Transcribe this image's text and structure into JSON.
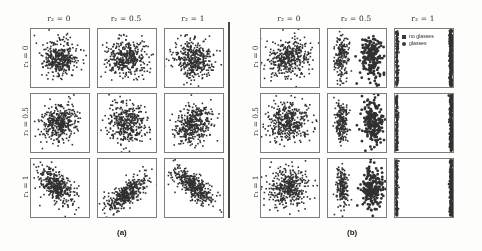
{
  "figure": {
    "panels": [
      {
        "id": "a",
        "caption": "(a)",
        "col_headers": [
          "r₂ = 0",
          "r₂ = 0.5",
          "r₂ = 1"
        ],
        "row_labels": [
          "r₁ = 0",
          "r₁ = 0.5",
          "r₁ = 1"
        ]
      },
      {
        "id": "b",
        "caption": "(b)",
        "col_headers": [
          "r₂ = 0",
          "r₂ = 0.5",
          "r₂ = 1"
        ],
        "row_labels": [
          "r₁ = 0",
          "r₁ = 0.5",
          "r₁ = 1"
        ]
      }
    ],
    "legend": {
      "entries": [
        {
          "label": "no glasses",
          "marker": "square-marker",
          "color": "#3b3b3b"
        },
        {
          "label": "glasses",
          "marker": "circle-marker",
          "color": "#3b3b3b"
        }
      ]
    }
  },
  "chart_data": {
    "type": "scatter",
    "title": "",
    "xlabel": "",
    "ylabel": "",
    "grid": false,
    "legend_position": "inside-top-right-cell",
    "point_color": "#333333",
    "point_size": 1.6,
    "xlim": [
      0,
      1
    ],
    "ylim": [
      0,
      1
    ],
    "row_param": "r₁",
    "col_param": "r₂",
    "row_values": [
      0,
      0.5,
      1
    ],
    "col_values": [
      0,
      0.5,
      1
    ],
    "n_points_per_cell": 400,
    "panels": [
      {
        "id": "a",
        "caption": "(a)",
        "description": "Embedding without disentanglement; single diffuse cloud per cell, becoming elongated and correlated as r1 increases",
        "cells": [
          {
            "row": 0,
            "col": 0,
            "mode": "blob",
            "cx": 0.5,
            "cy": 0.5,
            "sx": 0.155,
            "sy": 0.155,
            "rho": 0.0,
            "clusters": 1,
            "sep": 0.0
          },
          {
            "row": 0,
            "col": 1,
            "mode": "blob",
            "cx": 0.5,
            "cy": 0.5,
            "sx": 0.17,
            "sy": 0.16,
            "rho": 0.05,
            "clusters": 1,
            "sep": 0.0
          },
          {
            "row": 0,
            "col": 2,
            "mode": "blob",
            "cx": 0.5,
            "cy": 0.48,
            "sx": 0.165,
            "sy": 0.16,
            "rho": -0.05,
            "clusters": 1,
            "sep": 0.0
          },
          {
            "row": 1,
            "col": 0,
            "mode": "blob",
            "cx": 0.5,
            "cy": 0.5,
            "sx": 0.155,
            "sy": 0.16,
            "rho": 0.15,
            "clusters": 1,
            "sep": 0.0
          },
          {
            "row": 1,
            "col": 1,
            "mode": "blob",
            "cx": 0.5,
            "cy": 0.5,
            "sx": 0.17,
            "sy": 0.165,
            "rho": 0.0,
            "clusters": 1,
            "sep": 0.0
          },
          {
            "row": 1,
            "col": 2,
            "mode": "blob",
            "cx": 0.49,
            "cy": 0.48,
            "sx": 0.16,
            "sy": 0.16,
            "rho": 0.1,
            "clusters": 1,
            "sep": 0.0
          },
          {
            "row": 2,
            "col": 0,
            "mode": "blob",
            "cx": 0.44,
            "cy": 0.52,
            "sx": 0.15,
            "sy": 0.165,
            "rho": -0.55,
            "clusters": 1,
            "sep": 0.0
          },
          {
            "row": 2,
            "col": 1,
            "mode": "blob",
            "cx": 0.52,
            "cy": 0.42,
            "sx": 0.175,
            "sy": 0.14,
            "rho": 0.72,
            "clusters": 1,
            "sep": 0.0
          },
          {
            "row": 2,
            "col": 2,
            "mode": "blob",
            "cx": 0.48,
            "cy": 0.54,
            "sx": 0.17,
            "sy": 0.145,
            "rho": -0.68,
            "clusters": 1,
            "sep": 0.0
          }
        ]
      },
      {
        "id": "b",
        "caption": "(b)",
        "description": "Embedding with disentanglement; clusters split into two groups at r2=0.5 and collapse onto the left and right edges at r2=1",
        "cells": [
          {
            "row": 0,
            "col": 0,
            "mode": "blob",
            "cx": 0.48,
            "cy": 0.5,
            "sx": 0.18,
            "sy": 0.165,
            "rho": 0.1,
            "clusters": 1,
            "sep": 0.0
          },
          {
            "row": 0,
            "col": 1,
            "mode": "split",
            "cx": 0.5,
            "cy": 0.5,
            "sx": 0.06,
            "sy": 0.19,
            "rho": 0.0,
            "clusters": 2,
            "sep": 0.52
          },
          {
            "row": 0,
            "col": 2,
            "mode": "edges",
            "cx": 0.5,
            "cy": 0.5,
            "sx": 0.012,
            "sy": 0.3,
            "rho": 0.0,
            "clusters": 2,
            "sep": 0.93
          },
          {
            "row": 1,
            "col": 0,
            "mode": "blob",
            "cx": 0.47,
            "cy": 0.5,
            "sx": 0.18,
            "sy": 0.17,
            "rho": 0.05,
            "clusters": 1,
            "sep": 0.0
          },
          {
            "row": 1,
            "col": 1,
            "mode": "split",
            "cx": 0.5,
            "cy": 0.5,
            "sx": 0.058,
            "sy": 0.185,
            "rho": 0.0,
            "clusters": 2,
            "sep": 0.54
          },
          {
            "row": 1,
            "col": 2,
            "mode": "edges",
            "cx": 0.5,
            "cy": 0.5,
            "sx": 0.012,
            "sy": 0.3,
            "rho": 0.0,
            "clusters": 2,
            "sep": 0.94
          },
          {
            "row": 2,
            "col": 0,
            "mode": "blob",
            "cx": 0.46,
            "cy": 0.5,
            "sx": 0.185,
            "sy": 0.175,
            "rho": 0.08,
            "clusters": 1,
            "sep": 0.0
          },
          {
            "row": 2,
            "col": 1,
            "mode": "split",
            "cx": 0.48,
            "cy": 0.52,
            "sx": 0.055,
            "sy": 0.18,
            "rho": 0.0,
            "clusters": 2,
            "sep": 0.5
          },
          {
            "row": 2,
            "col": 2,
            "mode": "edges",
            "cx": 0.5,
            "cy": 0.5,
            "sx": 0.012,
            "sy": 0.3,
            "rho": 0.0,
            "clusters": 2,
            "sep": 0.94
          }
        ]
      }
    ]
  }
}
